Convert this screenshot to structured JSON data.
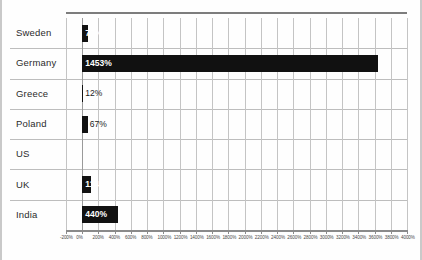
{
  "chart_data": {
    "type": "bar",
    "orientation": "horizontal",
    "title": "",
    "xlabel": "",
    "ylabel": "",
    "categories": [
      "Sweden",
      "Germany",
      "Greece",
      "Poland",
      "US",
      "UK",
      "India"
    ],
    "values": [
      77,
      1453,
      12,
      67,
      null,
      114,
      440
    ],
    "value_labels": [
      "77%",
      "1453%",
      "12%",
      "67%",
      "",
      "114%",
      "440%"
    ],
    "label_placement": [
      "inside",
      "inside",
      "outside",
      "outside",
      "none",
      "inside",
      "inside"
    ],
    "xlim": [
      -200,
      4000
    ],
    "xticks": [
      -200,
      0,
      200,
      400,
      600,
      800,
      1000,
      1200,
      1400,
      1600,
      1800,
      2000,
      2200,
      2400,
      2600,
      2800,
      3000,
      3200,
      3400,
      3600,
      3800,
      4000
    ],
    "xticklabels": [
      "-200%",
      "0%",
      "200%",
      "400%",
      "600%",
      "800%",
      "1000%",
      "1200%",
      "1400%",
      "1600%",
      "1800%",
      "2000%",
      "2200%",
      "2400%",
      "2600%",
      "2800%",
      "3000%",
      "3200%",
      "3400%",
      "3600%",
      "3800%",
      "4000%"
    ],
    "grid": true,
    "legend": false,
    "bar_color": "#111111",
    "grid_color": "#c4c4c4",
    "axis_color": "#8a8a8a",
    "bar_pixel_extent_pct": [
      77,
      3640,
      12,
      67,
      0,
      114,
      440
    ]
  }
}
